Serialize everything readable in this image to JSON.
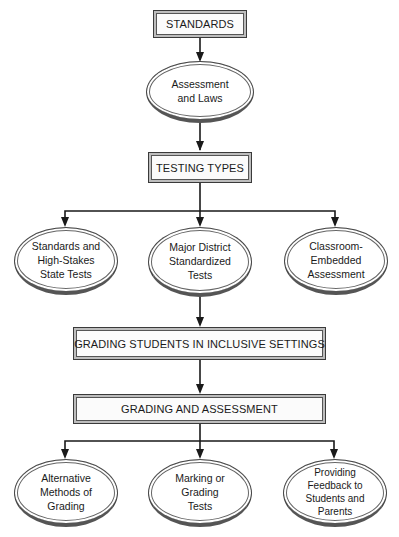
{
  "diagram": {
    "type": "flowchart",
    "nodes": {
      "standards": {
        "label": "STANDARDS",
        "shape": "rectangle"
      },
      "assessment_laws": {
        "label": "Assessment and Laws",
        "lines": [
          "Assessment",
          "and Laws"
        ],
        "shape": "ellipse"
      },
      "testing_types": {
        "label": "TESTING TYPES",
        "shape": "rectangle"
      },
      "state_tests": {
        "label": "Standards and High-Stakes State Tests",
        "lines": [
          "Standards and",
          "High-Stakes",
          "State Tests"
        ],
        "shape": "ellipse"
      },
      "district_tests": {
        "label": "Major District Standardized Tests",
        "lines": [
          "Major District",
          "Standardized",
          "Tests"
        ],
        "shape": "ellipse"
      },
      "classroom_assessment": {
        "label": "Classroom-Embedded Assessment",
        "lines": [
          "Classroom-",
          "Embedded",
          "Assessment"
        ],
        "shape": "ellipse"
      },
      "grading_inclusive": {
        "label": "GRADING STUDENTS IN INCLUSIVE SETTINGS",
        "shape": "rectangle"
      },
      "grading_assessment": {
        "label": "GRADING AND ASSESSMENT",
        "shape": "rectangle"
      },
      "alt_methods": {
        "label": "Alternative Methods of Grading",
        "lines": [
          "Alternative",
          "Methods of",
          "Grading"
        ],
        "shape": "ellipse"
      },
      "marking_tests": {
        "label": "Marking or Grading Tests",
        "lines": [
          "Marking or",
          "Grading",
          "Tests"
        ],
        "shape": "ellipse"
      },
      "feedback": {
        "label": "Providing Feedback to Students and Parents",
        "lines": [
          "Providing",
          "Feedback to",
          "Students and",
          "Parents"
        ],
        "shape": "ellipse"
      }
    },
    "edges": [
      [
        "standards",
        "assessment_laws"
      ],
      [
        "assessment_laws",
        "testing_types"
      ],
      [
        "testing_types",
        "state_tests"
      ],
      [
        "testing_types",
        "district_tests"
      ],
      [
        "testing_types",
        "classroom_assessment"
      ],
      [
        "district_tests",
        "grading_inclusive"
      ],
      [
        "grading_inclusive",
        "grading_assessment"
      ],
      [
        "grading_assessment",
        "alt_methods"
      ],
      [
        "grading_assessment",
        "marking_tests"
      ],
      [
        "grading_assessment",
        "feedback"
      ]
    ],
    "colors": {
      "line": "#1a1a1a",
      "box_bevel": "#bdbdbd",
      "background": "#ffffff"
    }
  }
}
